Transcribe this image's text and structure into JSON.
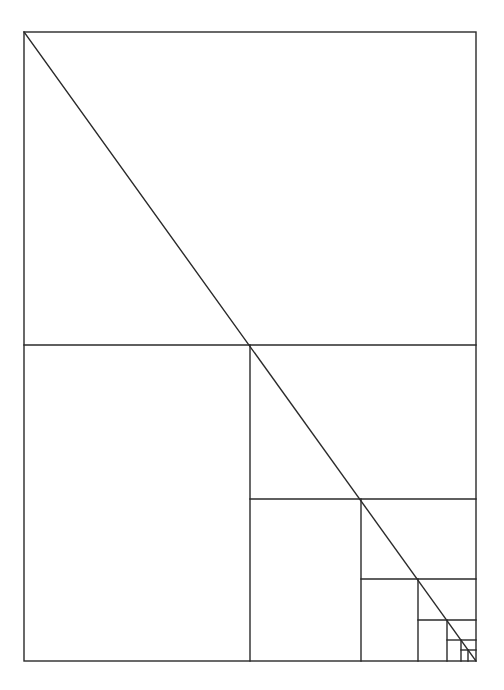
{
  "diagram": {
    "title": "",
    "stroke_color": "#2a2a2a",
    "background": "#ffffff",
    "outer_rect": {
      "x1": 24,
      "y1": 32,
      "x2": 476,
      "y2": 661
    },
    "diagonal": {
      "x1": 24,
      "y1": 32,
      "x2": 476,
      "y2": 661
    },
    "subdivisions": [
      {
        "level": 1,
        "hline": {
          "y": 345,
          "x1": 24,
          "x2": 476
        },
        "vline": {
          "x": 250,
          "y1": 345,
          "y2": 661
        }
      },
      {
        "level": 2,
        "hline": {
          "y": 499,
          "x1": 250,
          "x2": 476
        },
        "vline": {
          "x": 361,
          "y1": 499,
          "y2": 661
        }
      },
      {
        "level": 3,
        "hline": {
          "y": 579,
          "x1": 361,
          "x2": 476
        },
        "vline": {
          "x": 418,
          "y1": 579,
          "y2": 661
        }
      },
      {
        "level": 4,
        "hline": {
          "y": 620,
          "x1": 418,
          "x2": 476
        },
        "vline": {
          "x": 447,
          "y1": 620,
          "y2": 661
        }
      },
      {
        "level": 5,
        "hline": {
          "y": 640,
          "x1": 447,
          "x2": 476
        },
        "vline": {
          "x": 461,
          "y1": 640,
          "y2": 661
        }
      },
      {
        "level": 6,
        "hline": {
          "y": 650,
          "x1": 461,
          "x2": 476
        },
        "vline": {
          "x": 468,
          "y1": 650,
          "y2": 661
        }
      }
    ]
  }
}
